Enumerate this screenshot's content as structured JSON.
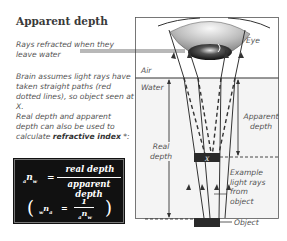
{
  "title": "Apparent depth",
  "notes": {
    "rays_refracted": "Rays refracted when they leave water",
    "brain_assumes": "Brain assumes light rays have taken straight paths (red dotted lines), so object seen at X.",
    "real_apparent_prefix": "Real depth and apparent depth can also be used to calculate ",
    "refractive_index": "refractive index",
    "real_apparent_suffix": " *:"
  },
  "formula": {
    "lhs_pre": "a",
    "lhs_n": "n",
    "lhs_sub": "w",
    "equals": "=",
    "numerator": "real depth",
    "denominator": "apparent depth",
    "inverse_lhs_pre": "w",
    "inverse_lhs_n": "n",
    "inverse_lhs_sub": "a",
    "inverse_equals": "=",
    "inverse_numerator": "1",
    "inverse_den_pre": "a",
    "inverse_den_n": "n",
    "inverse_den_sub": "w"
  },
  "diagram_labels": {
    "eye": "Eye",
    "air": "Air",
    "water": "Water",
    "apparent_depth": "Apparent depth",
    "real_depth": "Real depth",
    "example_rays": "Example light rays from object",
    "object": "Object",
    "image_marker": "X"
  },
  "colors": {
    "ink": "#333333",
    "water_fill": "#f4f4f4",
    "formula_bg": "#111111",
    "object": "#2a2a2a"
  }
}
